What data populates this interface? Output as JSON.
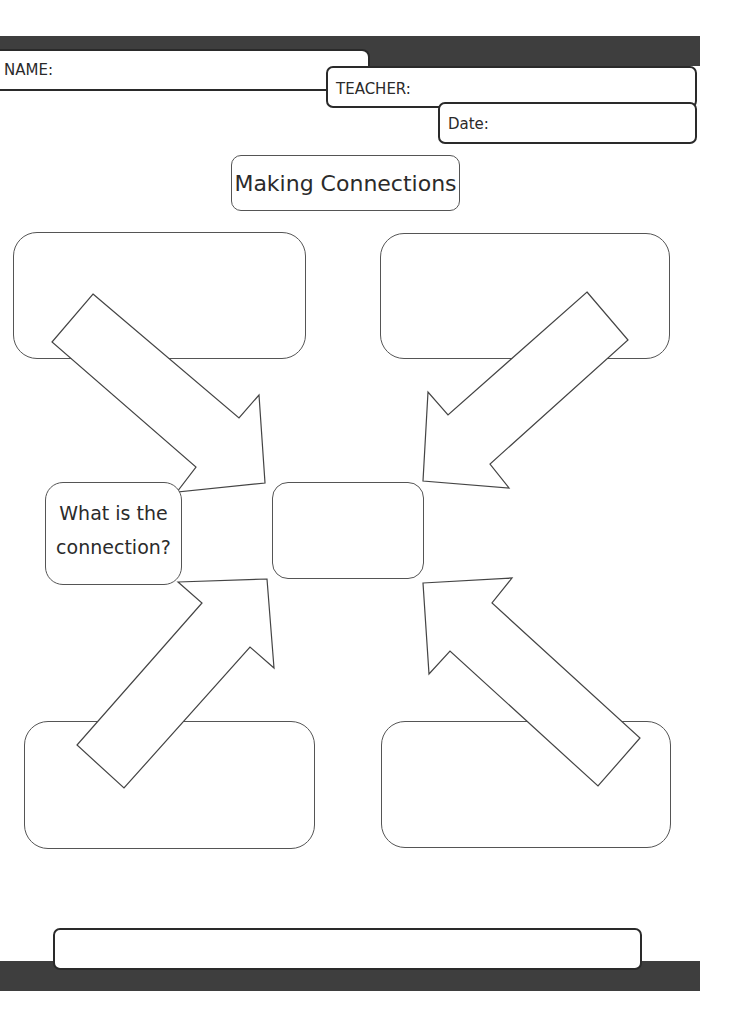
{
  "header": {
    "name_label": "NAME:",
    "teacher_label": "TEACHER:",
    "date_label": "Date:",
    "bar_color": "#3e3e3e"
  },
  "title": "Making Connections",
  "question_box": {
    "line1": "What is the",
    "line2": "connection?"
  },
  "boxes": [
    {
      "id": "top-left",
      "content": ""
    },
    {
      "id": "top-right",
      "content": ""
    },
    {
      "id": "center",
      "content": ""
    },
    {
      "id": "bottom-left",
      "content": ""
    },
    {
      "id": "bottom-right",
      "content": ""
    }
  ],
  "footer": {
    "answer_box_content": "",
    "bar_color": "#3e3e3e"
  }
}
